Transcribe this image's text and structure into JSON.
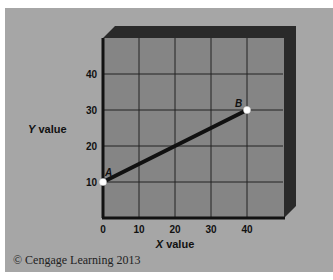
{
  "chart_data": {
    "type": "line",
    "title": "",
    "xlabel": "X value",
    "xlabel_italic_part": "X",
    "xlabel_rest": " value",
    "ylabel": "Y value",
    "ylabel_italic_part": "Y",
    "ylabel_rest": " value",
    "xlim": [
      0,
      50
    ],
    "ylim": [
      0,
      50
    ],
    "x_ticks": [
      0,
      10,
      20,
      30,
      40
    ],
    "y_ticks": [
      10,
      20,
      30,
      40
    ],
    "grid": true,
    "series": [
      {
        "name": "AB",
        "points": [
          {
            "label": "A",
            "x": 0,
            "y": 10
          },
          {
            "label": "B",
            "x": 40,
            "y": 30
          }
        ]
      }
    ]
  },
  "colors": {
    "panel_bg": "#a6a6a6",
    "plot_bg": "#858585",
    "frame": "#2a2a2a",
    "grid": "#222222",
    "line": "#111111",
    "point": "#ffffff"
  },
  "credit": "© Cengage Learning 2013"
}
